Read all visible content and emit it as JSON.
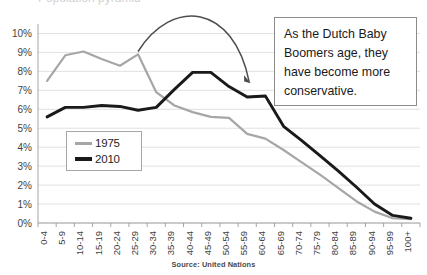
{
  "chart_data": {
    "type": "line",
    "title": "",
    "xlabel": "",
    "ylabel": "",
    "ylim": [
      0,
      10.5
    ],
    "ytick_labels": [
      "0%",
      "1%",
      "2%",
      "3%",
      "4%",
      "5%",
      "6%",
      "7%",
      "8%",
      "9%",
      "10%"
    ],
    "ytick_values": [
      0,
      1,
      2,
      3,
      4,
      5,
      6,
      7,
      8,
      9,
      10
    ],
    "grid": true,
    "legend_position": "inside-left",
    "categories": [
      "0-4",
      "5-9",
      "10-14",
      "15-19",
      "20-24",
      "25-29",
      "30-34",
      "35-39",
      "40-44",
      "45-49",
      "50-54",
      "55-59",
      "60-64",
      "65-69",
      "70-74",
      "75-79",
      "80-84",
      "85-89",
      "90-94",
      "95-99",
      "100+"
    ],
    "series": [
      {
        "name": "1975",
        "color": "#a6a6a6",
        "values": [
          7.5,
          8.85,
          9.05,
          8.65,
          8.3,
          8.9,
          6.9,
          6.2,
          5.85,
          5.6,
          5.55,
          4.7,
          4.45,
          3.85,
          3.2,
          2.55,
          1.85,
          1.15,
          0.6,
          0.25,
          0.2
        ]
      },
      {
        "name": "2010",
        "color": "#1a1a1a",
        "values": [
          5.6,
          6.1,
          6.1,
          6.2,
          6.15,
          5.95,
          6.1,
          7.05,
          7.95,
          7.95,
          7.2,
          6.65,
          6.7,
          5.1,
          4.35,
          3.55,
          2.75,
          1.9,
          1.0,
          0.4,
          0.25
        ]
      }
    ],
    "annotations": [
      {
        "name": "aging-cohort-arrow",
        "kind": "curved-arrow",
        "from_category": "25-29",
        "to_category": "55-59"
      }
    ]
  },
  "callout": {
    "text": "As the Dutch Baby Boomers age, they have become more conservative."
  },
  "legend": {
    "items": [
      {
        "label": "1975",
        "color": "#a6a6a6"
      },
      {
        "label": "2010",
        "color": "#1a1a1a"
      }
    ]
  },
  "source": {
    "text": "Source: United Nations"
  },
  "title_sliver": {
    "text": "Population pyramid"
  }
}
